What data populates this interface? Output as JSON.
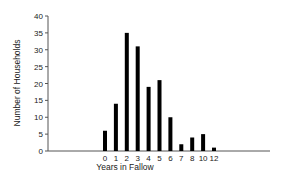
{
  "chart_data": {
    "type": "bar",
    "title": "",
    "xlabel": "Years in Fallow",
    "ylabel": "Number of Households",
    "categories": [
      "0",
      "1",
      "2",
      "3",
      "4",
      "5",
      "6",
      "7",
      "8",
      "10",
      "12"
    ],
    "values": [
      6,
      14,
      35,
      31,
      19,
      21,
      10,
      2,
      4,
      5,
      1
    ],
    "ylim": [
      0,
      40
    ],
    "yticks": [
      0,
      5,
      10,
      15,
      20,
      25,
      30,
      35,
      40
    ],
    "grid": false,
    "legend": null,
    "bar_color": "#000000"
  }
}
